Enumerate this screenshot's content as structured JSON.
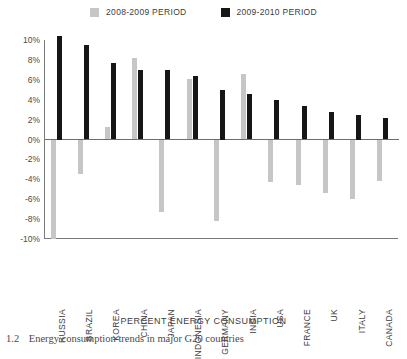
{
  "legend": {
    "entries": [
      {
        "label": "2008-2009 PERIOD",
        "color": "#c6c6c6",
        "swatch_name": "legend-swatch-light"
      },
      {
        "label": "2009-2010 PERIOD",
        "color": "#161616",
        "swatch_name": "legend-swatch-dark"
      }
    ]
  },
  "axis": {
    "x_title": "PERCENT ENERGY CONSUMPTION",
    "y_ticks": [
      "10%",
      "8%",
      "6%",
      "4%",
      "2%",
      "0%",
      "-2%",
      "-4%",
      "-6%",
      "-8%",
      "-10%"
    ]
  },
  "caption": {
    "number": "1.2",
    "text": "Energy consumption trends in major G20 countries"
  },
  "chart_data": {
    "type": "bar",
    "title": "",
    "subtitle": "",
    "xlabel": "PERCENT ENERGY CONSUMPTION",
    "ylabel": "",
    "ylim": [
      -10,
      10
    ],
    "ytick_step": 2,
    "grid": false,
    "legend_position": "top-center",
    "categories": [
      "RUSSIA",
      "BRAZIL",
      "KOREA",
      "CHINA",
      "JAPAN",
      "INDONESIA",
      "GERMANY",
      "INDIA",
      "USA",
      "FRANCE",
      "UK",
      "ITALY",
      "CANADA"
    ],
    "series": [
      {
        "name": "2008-2009 PERIOD",
        "color": "#c6c6c6",
        "values": [
          -10.0,
          -3.5,
          1.3,
          8.2,
          -7.3,
          6.1,
          -8.2,
          6.6,
          -4.3,
          -4.6,
          -5.4,
          -6.0,
          -4.2
        ]
      },
      {
        "name": "2009-2010 PERIOD",
        "color": "#161616",
        "values": [
          10.4,
          9.5,
          7.7,
          7.0,
          7.0,
          6.4,
          5.0,
          4.6,
          4.0,
          3.4,
          2.8,
          2.5,
          2.2
        ]
      }
    ]
  }
}
